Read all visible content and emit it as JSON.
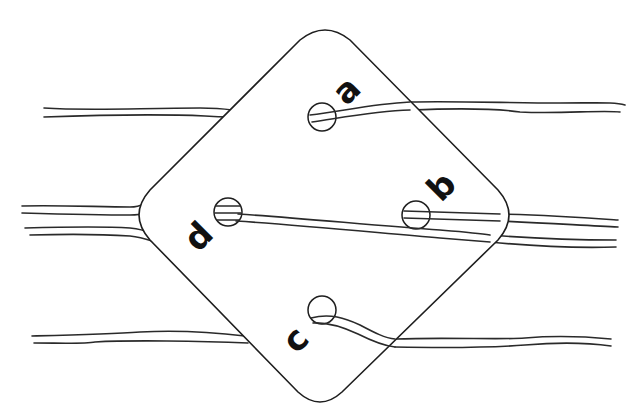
{
  "diagram": {
    "card": {
      "shape": "rounded-square rotated 45deg",
      "stroke": "#1e1e1e",
      "fill": "#ffffff"
    },
    "holes": [
      {
        "id": "a",
        "label": "a",
        "position": "top"
      },
      {
        "id": "b",
        "label": "b",
        "position": "right"
      },
      {
        "id": "c",
        "label": "c",
        "position": "bottom"
      },
      {
        "id": "d",
        "label": "d",
        "position": "left"
      }
    ],
    "threads": [
      {
        "id": "thread-top",
        "through_hole": "a"
      },
      {
        "id": "thread-middle",
        "through_hole": "d"
      },
      {
        "id": "thread-middle-b",
        "through_hole": "b"
      },
      {
        "id": "thread-bottom",
        "through_hole": "c"
      }
    ],
    "colors": {
      "line": "#1e1e1e",
      "background": "#ffffff",
      "label": "#111111"
    }
  }
}
